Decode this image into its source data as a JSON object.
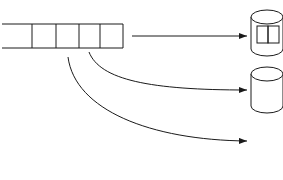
{
  "diagram": {
    "file_label": "File 1",
    "file_cells": [
      {
        "letter": "D",
        "sub": "1"
      },
      {
        "letter": "C",
        "sub": "1"
      },
      {
        "letter": "B",
        "sub": "1"
      },
      {
        "letter": "A",
        "sub": "1"
      }
    ],
    "disks": [
      {
        "name": "disk-1",
        "blocks": [
          {
            "letter": "A",
            "sub": "1"
          },
          {
            "letter": "D",
            "sub": "1"
          }
        ]
      },
      {
        "name": "disk-2",
        "blocks": [
          {
            "letter": "B",
            "sub": "1"
          }
        ]
      },
      {
        "name": "disk-3",
        "blocks": [
          {
            "letter": "C",
            "sub": "1"
          }
        ]
      }
    ],
    "arrows": [
      {
        "from": "file-1",
        "to": "disk-1",
        "type": "straight"
      },
      {
        "from": "B1",
        "to": "disk-2",
        "type": "curved"
      },
      {
        "from": "C1",
        "to": "disk-3",
        "type": "curved"
      }
    ],
    "colors": {
      "stroke": "#1a1a1a",
      "background": "#ffffff"
    }
  }
}
